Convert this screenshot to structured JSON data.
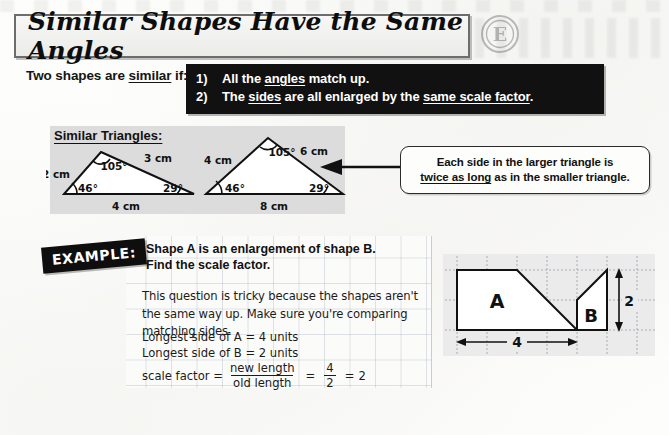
{
  "page": {
    "title": "Similar Shapes Have the Same Angles",
    "badge_letter": "E"
  },
  "intro": {
    "lead_a": "Two shapes are ",
    "lead_underlined": "similar",
    "lead_b": " if:",
    "rules": [
      {
        "number": "1)",
        "parts": [
          {
            "text": "All the ",
            "underline": false
          },
          {
            "text": "angles",
            "underline": true
          },
          {
            "text": " match up.",
            "underline": false
          }
        ]
      },
      {
        "number": "2)",
        "parts": [
          {
            "text": "The ",
            "underline": false
          },
          {
            "text": "sides",
            "underline": true
          },
          {
            "text": " are all enlarged by the ",
            "underline": false
          },
          {
            "text": "same scale factor",
            "underline": true
          },
          {
            "text": ".",
            "underline": false
          }
        ]
      }
    ]
  },
  "triangles": {
    "heading": "Similar Triangles:",
    "small": {
      "side_left": "2 cm",
      "side_right": "3 cm",
      "side_base": "4 cm",
      "angle_apex": "105°",
      "angle_left": "46°",
      "angle_right": "29°"
    },
    "large": {
      "side_left": "4 cm",
      "side_right": "6 cm",
      "side_base": "8 cm",
      "angle_apex": "105°",
      "angle_left": "46°",
      "angle_right": "29°"
    }
  },
  "callout": {
    "line1": "Each side in the larger triangle is",
    "line2_underlined": "twice as long",
    "line2_rest": " as in the smaller triangle."
  },
  "example": {
    "badge": "EXAMPLE:",
    "question_line1": "Shape A is an enlargement of shape B.",
    "question_line2": "Find the scale factor.",
    "explanation": "This question is tricky because the shapes aren't the same way up.  Make sure you're comparing matching sides.",
    "step1": "Longest side of A = 4 units",
    "step2": "Longest side of B = 2 units",
    "formula": {
      "label": "scale factor =",
      "numerator": "new length",
      "denominator": "old length",
      "eq1": "=",
      "frac_num": "4",
      "frac_den": "2",
      "eq2": "=",
      "result": "2"
    }
  },
  "shapes_diagram": {
    "shape_a_label": "A",
    "shape_b_label": "B",
    "dim_a": "4",
    "dim_b": "2"
  },
  "colors": {
    "panel_grey": "#dcdcdc",
    "shapes_grey": "#ebebeb",
    "ink": "#111111",
    "grid_blue": "#96a5b9"
  }
}
